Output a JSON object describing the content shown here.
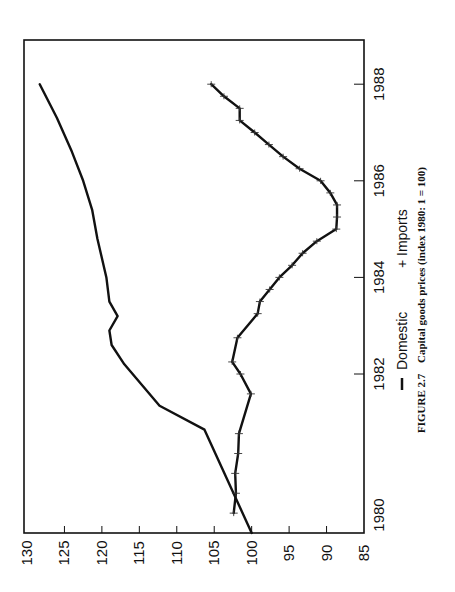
{
  "chart_data": {
    "type": "line",
    "orientation": "rotated-90-ccw",
    "title": "",
    "caption_prefix": "FIGURE 2.7",
    "caption": "Capital goods prices (index 1980: 1 = 100)",
    "xlabel": "",
    "ylabel": "",
    "xlim": [
      1980,
      1989
    ],
    "ylim": [
      85,
      130
    ],
    "x_ticks": [
      1980,
      1982,
      1984,
      1986,
      1988
    ],
    "x_tick_labels": [
      "1980",
      "1982",
      "1984",
      "1986",
      "1988"
    ],
    "y_ticks": [
      130,
      125,
      120,
      115,
      110,
      105,
      100,
      95,
      90,
      85
    ],
    "y_tick_labels": [
      "130",
      "125",
      "120",
      "115",
      "110",
      "105",
      "100",
      "95",
      "90",
      "85"
    ],
    "grid": false,
    "legend": {
      "placement": "bottom",
      "entries": [
        {
          "marker": "line",
          "symbol": "—",
          "label": "Domestic"
        },
        {
          "marker": "plus",
          "symbol": "+",
          "label": "Imports"
        }
      ]
    },
    "series": [
      {
        "name": "Domestic",
        "marker": "none",
        "x": [
          1980.0,
          1981.3,
          1981.6,
          1982.2,
          1982.6,
          1982.9,
          1983.2,
          1983.5,
          1984.0,
          1984.8,
          1985.4,
          1986.0,
          1986.6,
          1987.3,
          1988.0
        ],
        "values": [
          100.0,
          106.3,
          112.3,
          117.0,
          118.7,
          119.0,
          117.9,
          119.0,
          119.4,
          120.6,
          121.3,
          122.5,
          124.0,
          126.0,
          128.3
        ]
      },
      {
        "name": "Imports",
        "marker": "plus",
        "x": [
          1980.25,
          1980.5,
          1980.75,
          1981.0,
          1981.25,
          1981.75,
          1982.0,
          1982.25,
          1982.75,
          1983.25,
          1983.5,
          1983.75,
          1984.0,
          1984.25,
          1984.5,
          1984.75,
          1985.0,
          1985.25,
          1985.5,
          1985.75,
          1986.0,
          1986.25,
          1986.5,
          1986.75,
          1987.0,
          1987.25,
          1987.5,
          1987.75,
          1988.0
        ],
        "values": [
          102.4,
          102.1,
          102.2,
          101.8,
          101.7,
          100.1,
          101.5,
          102.6,
          101.9,
          99.2,
          98.9,
          97.6,
          96.3,
          94.6,
          93.2,
          91.3,
          88.7,
          88.6,
          88.6,
          89.5,
          90.8,
          93.6,
          95.8,
          97.7,
          99.6,
          101.6,
          101.6,
          103.7,
          105.4
        ]
      }
    ]
  }
}
